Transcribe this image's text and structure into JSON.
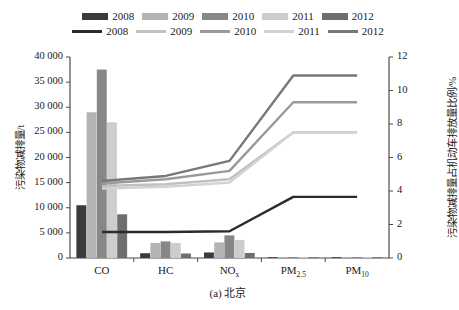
{
  "caption": "(a) 北京",
  "axes": {
    "left_title": "污染物减排量/t",
    "right_title": "污染物减排量占机动车排放量比例/%",
    "left_ticks": [
      "0",
      "5 000",
      "10 000",
      "15 000",
      "20 000",
      "25 000",
      "30 000",
      "35 000",
      "40 000"
    ],
    "right_ticks": [
      "0",
      "2",
      "4",
      "6",
      "8",
      "10",
      "12"
    ]
  },
  "legend": {
    "bar_row": [
      {
        "label": "2008",
        "color": "#3b3b3b",
        "type": "bar"
      },
      {
        "label": "2009",
        "color": "#b4b4b4",
        "type": "bar"
      },
      {
        "label": "2010",
        "color": "#878787",
        "type": "bar"
      },
      {
        "label": "2011",
        "color": "#cdcdcd",
        "type": "bar"
      },
      {
        "label": "2012",
        "color": "#6e6e6e",
        "type": "bar"
      }
    ],
    "line_row": [
      {
        "label": "2008",
        "color": "#2b2b2b",
        "type": "line"
      },
      {
        "label": "2009",
        "color": "#c0c0c0",
        "type": "line"
      },
      {
        "label": "2010",
        "color": "#9a9a9a",
        "type": "line"
      },
      {
        "label": "2011",
        "color": "#d2d2d2",
        "type": "line"
      },
      {
        "label": "2012",
        "color": "#787878",
        "type": "line"
      }
    ]
  },
  "chart_data": {
    "type": "bar",
    "title": "",
    "subtitle": "",
    "xlabel": "",
    "ylabel": "污染物减排量/t",
    "y2label": "污染物减排量占机动车排放量比例/%",
    "categories": [
      "CO",
      "HC",
      "NOx",
      "PM2.5",
      "PM10"
    ],
    "category_labels_html": [
      "CO",
      "HC",
      "NO<sub>x</sub>",
      "PM<sub>2.5</sub>",
      "PM<sub>10</sub>"
    ],
    "ylim": [
      0,
      40000
    ],
    "y2lim": [
      0,
      12
    ],
    "ytick_step": 5000,
    "y2tick_step": 2,
    "grid": false,
    "legend_position": "top",
    "bar_series": [
      {
        "name": "2008",
        "color": "#3b3b3b",
        "values": [
          10500,
          950,
          1100,
          60,
          50
        ]
      },
      {
        "name": "2009",
        "color": "#b4b4b4",
        "values": [
          29000,
          3000,
          3100,
          160,
          130
        ]
      },
      {
        "name": "2010",
        "color": "#878787",
        "values": [
          37500,
          3300,
          4500,
          180,
          150
        ]
      },
      {
        "name": "2011",
        "color": "#cdcdcd",
        "values": [
          27000,
          3000,
          3600,
          170,
          140
        ]
      },
      {
        "name": "2012",
        "color": "#6e6e6e",
        "values": [
          8700,
          900,
          1000,
          60,
          50
        ]
      }
    ],
    "line_series": [
      {
        "name": "2008",
        "color": "#2b2b2b",
        "values": [
          1.55,
          1.55,
          1.6,
          3.65,
          3.65
        ]
      },
      {
        "name": "2009",
        "color": "#c0c0c0",
        "values": [
          4.3,
          4.4,
          4.7,
          7.5,
          7.5
        ]
      },
      {
        "name": "2010",
        "color": "#9a9a9a",
        "values": [
          4.45,
          4.7,
          5.2,
          9.3,
          9.3
        ]
      },
      {
        "name": "2011",
        "color": "#d2d2d2",
        "values": [
          4.15,
          4.25,
          4.5,
          7.5,
          7.5
        ]
      },
      {
        "name": "2012",
        "color": "#787878",
        "values": [
          4.6,
          4.9,
          5.8,
          10.9,
          10.9
        ]
      }
    ]
  }
}
